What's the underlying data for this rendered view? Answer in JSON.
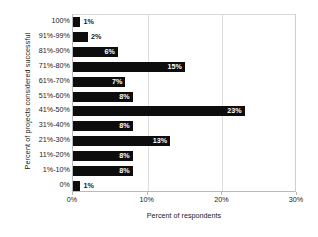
{
  "chart_data": {
    "type": "bar",
    "orientation": "horizontal",
    "title": "",
    "xlabel": "Percent of respondents",
    "ylabel": "Percent of projects considered successful",
    "categories": [
      "100%",
      "91%-99%",
      "81%-90%",
      "71%-80%",
      "61%-70%",
      "51%-60%",
      "41%-50%",
      "31%-40%",
      "21%-30%",
      "11%-20%",
      "1%-10%",
      "0%"
    ],
    "values": [
      1,
      2,
      6,
      15,
      7,
      8,
      23,
      8,
      13,
      8,
      8,
      1
    ],
    "data_labels": [
      "1%",
      "2%",
      "6%",
      "15%",
      "7%",
      "8%",
      "23%",
      "8%",
      "13%",
      "8%",
      "8%",
      "1%"
    ],
    "label_placement": [
      "outside",
      "outside",
      "inside",
      "inside",
      "inside",
      "inside",
      "inside",
      "inside",
      "inside",
      "inside",
      "inside",
      "outside"
    ],
    "xlim": [
      0,
      30
    ],
    "xticks": [
      0,
      10,
      20,
      30
    ],
    "xticklabels": [
      "0%",
      "10%",
      "20%",
      "30%"
    ],
    "grid": "vertical",
    "legend": "none",
    "bar_color": "#0d0d0d",
    "inside_label_color": "#ffffff",
    "outside_label_color": "#1a1a1a"
  }
}
